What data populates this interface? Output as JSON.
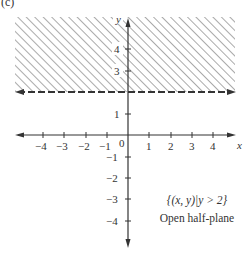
{
  "figure": {
    "panel_label": "(c)",
    "set_notation": "{(x, y)|y > 2}",
    "caption": "Open half-plane",
    "axis_x_label": "x",
    "axis_y_label": "y",
    "origin_label": "0",
    "x_ticks": [
      "-4",
      "-3",
      "-2",
      "-1",
      "1",
      "2",
      "3",
      "4"
    ],
    "y_ticks_upper": [
      "4",
      "3"
    ],
    "y_ticks_lower": [
      "1",
      "-1",
      "-2",
      "-3",
      "-4"
    ],
    "boundary": "y = 2 (dashed, not included)",
    "shaded_region": "y > 2"
  },
  "colors": {
    "ink": "#333333",
    "hatch": "#555555",
    "background": "#ffffff"
  }
}
